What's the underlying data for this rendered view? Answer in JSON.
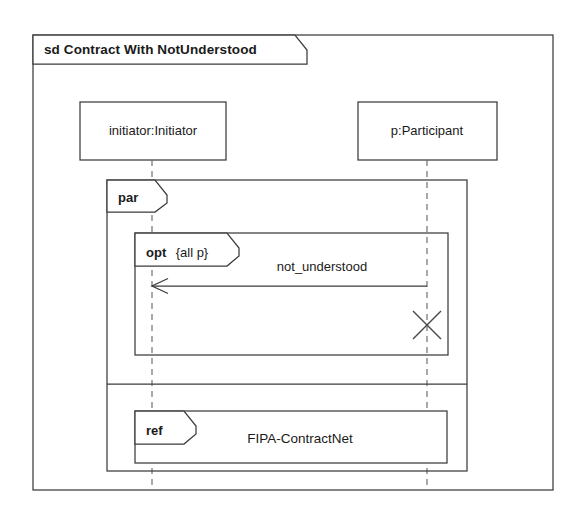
{
  "diagram": {
    "kind": "uml-sequence-diagram",
    "frame_label": "sd Contract With NotUnderstood",
    "frame_keyword": "sd",
    "frame_name": "Contract With NotUnderstood"
  },
  "lifelines": [
    {
      "id": "initiator",
      "label": "initiator:Initiator",
      "x": 152
    },
    {
      "id": "participant",
      "label": "p:Participant",
      "x": 427
    }
  ],
  "fragments": [
    {
      "id": "par",
      "operator": "par",
      "guard": "",
      "label": "par",
      "operands": 2
    },
    {
      "id": "opt",
      "operator": "opt",
      "guard": "{all p}",
      "label": "opt",
      "guard_label": "{all p}"
    },
    {
      "id": "ref",
      "operator": "ref",
      "label": "ref",
      "reference_name": "FIPA-ContractNet"
    }
  ],
  "messages": [
    {
      "id": "not-understood",
      "name": "not_understood",
      "from": "participant",
      "to": "initiator",
      "arrow": "open",
      "style": "solid"
    }
  ],
  "markers": [
    {
      "id": "stop-marker",
      "type": "destruction-x",
      "on": "participant"
    }
  ],
  "colors": {
    "line": "#3b3b3b",
    "dashed_line": "#6b6b6b",
    "text": "#1a1a1a",
    "background": "#ffffff"
  }
}
